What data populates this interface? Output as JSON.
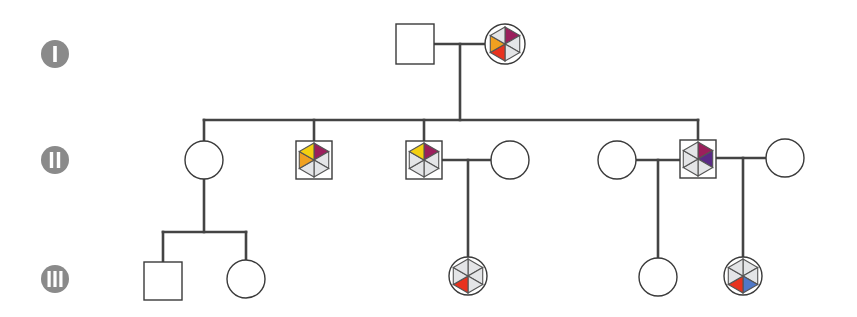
{
  "colors": {
    "line": "#444444",
    "label_bg": "#8a8a8a",
    "gray_segment": "#e4e5e7",
    "purple": "#9b1f5c",
    "dark_purple": "#5b2a86",
    "orange": "#f0a020",
    "yellow": "#f4d010",
    "red": "#e8321e",
    "blue": "#4f78c8"
  },
  "generations": [
    {
      "label": "I",
      "y": 44
    },
    {
      "label": "II",
      "y": 160
    },
    {
      "label": "III",
      "y": 279
    }
  ],
  "individuals": [
    {
      "id": "I-1",
      "sex": "male",
      "generation": "I",
      "x": 415,
      "y": 44,
      "marked": false
    },
    {
      "id": "I-2",
      "sex": "female",
      "generation": "I",
      "x": 505,
      "y": 44,
      "marked": true,
      "segments": [
        "purple",
        "gray",
        "gray",
        "red",
        "orange",
        "gray"
      ]
    },
    {
      "id": "II-1",
      "sex": "female",
      "generation": "II",
      "x": 204,
      "y": 160,
      "marked": false
    },
    {
      "id": "II-2",
      "sex": "male",
      "generation": "II",
      "x": 314,
      "y": 160,
      "marked": true,
      "segments": [
        "purple",
        "gray",
        "gray",
        "gray",
        "orange",
        "yellow"
      ]
    },
    {
      "id": "II-3",
      "sex": "male",
      "generation": "II",
      "x": 424,
      "y": 160,
      "marked": true,
      "segments": [
        "purple",
        "gray",
        "gray",
        "gray",
        "gray",
        "yellow"
      ]
    },
    {
      "id": "II-4",
      "sex": "female",
      "generation": "II",
      "x": 510,
      "y": 160,
      "marked": false
    },
    {
      "id": "II-5",
      "sex": "female",
      "generation": "II",
      "x": 617,
      "y": 160,
      "marked": false
    },
    {
      "id": "II-6",
      "sex": "male",
      "generation": "II",
      "x": 698,
      "y": 159,
      "marked": true,
      "segments": [
        "purple",
        "dark_purple",
        "gray",
        "gray",
        "gray",
        "gray"
      ]
    },
    {
      "id": "II-7",
      "sex": "female",
      "generation": "II",
      "x": 785,
      "y": 158,
      "marked": false
    },
    {
      "id": "III-1",
      "sex": "male",
      "generation": "III",
      "x": 163,
      "y": 281,
      "marked": false
    },
    {
      "id": "III-2",
      "sex": "female",
      "generation": "III",
      "x": 246,
      "y": 279,
      "marked": false
    },
    {
      "id": "III-3",
      "sex": "female",
      "generation": "III",
      "x": 468,
      "y": 276,
      "marked": true,
      "segments": [
        "gray",
        "gray",
        "gray",
        "red",
        "gray",
        "gray"
      ]
    },
    {
      "id": "III-4",
      "sex": "female",
      "generation": "III",
      "x": 658,
      "y": 277,
      "marked": false
    },
    {
      "id": "III-5",
      "sex": "female",
      "generation": "III",
      "x": 743,
      "y": 276,
      "marked": true,
      "segments": [
        "gray",
        "gray",
        "blue",
        "red",
        "gray",
        "gray"
      ]
    }
  ]
}
